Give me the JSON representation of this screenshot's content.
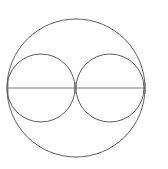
{
  "canvas": {
    "width": 168,
    "height": 169,
    "background_color": "#ffffff",
    "title": "Circle with two inscribed tangent circles"
  },
  "style": {
    "stroke_color": "#4a4a4a",
    "stroke_color_dark": "#3a3a3a",
    "stroke_color_light": "#6e6e6e",
    "stroke_width": 0.9,
    "line_stroke_width": 0.8
  },
  "shapes": {
    "outer_circle": {
      "label": "outer-circle",
      "cx": 76,
      "cy": 88,
      "r": 69,
      "stroke": "#4a4a4a"
    },
    "left_circle": {
      "label": "left-inner-circle",
      "cx": 41,
      "cy": 88,
      "r": 34,
      "stroke": "#4a4a4a"
    },
    "right_circle": {
      "label": "right-inner-circle",
      "cx": 110,
      "cy": 88,
      "r": 34,
      "stroke": "#4a4a4a"
    },
    "diameter_line": {
      "label": "horizontal-diameter",
      "x1": 8,
      "y1": 88,
      "x2": 145,
      "y2": 88,
      "stroke": "#5a5a5a"
    },
    "tick_center": {
      "label": "center-tick",
      "x": 75,
      "y1": 82,
      "y2": 94,
      "stroke": "#5a5a5a"
    },
    "tick_right": {
      "label": "right-end-tick",
      "x": 145,
      "y1": 82,
      "y2": 94,
      "stroke": "#5a5a5a"
    },
    "tick_left": {
      "label": "left-end-tick",
      "x": 8,
      "y1": 80,
      "y2": 96,
      "stroke": "#6e6e6e"
    }
  },
  "annotations": {
    "caption": "",
    "labels": []
  }
}
